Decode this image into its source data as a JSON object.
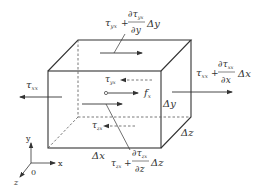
{
  "diagram": {
    "labels": {
      "top_term": "τ",
      "top_sub": "yx",
      "top_plus": "+",
      "top_num": "∂τ",
      "top_num_sub": "yx",
      "top_den": "∂y",
      "top_delta": "Δy",
      "right_term": "τ",
      "right_sub": "xx",
      "right_plus": "+",
      "right_num": "∂τ",
      "right_num_sub": "xx",
      "right_den": "∂x",
      "right_delta": "Δx",
      "left_term": "τ",
      "left_sub": "xx",
      "inner_top_term": "τ",
      "inner_top_sub": "yx",
      "body_force": "f",
      "body_force_sub": "x",
      "inner_bottom_term": "τ",
      "inner_bottom_sub": "zx",
      "bottom_term": "τ",
      "bottom_sub": "zx",
      "bottom_plus": "+",
      "bottom_num": "∂τ",
      "bottom_num_sub": "zx",
      "bottom_den": "∂z",
      "bottom_delta": "Δz",
      "dim_x": "Δx",
      "dim_y": "Δy",
      "dim_z": "Δz"
    },
    "axes": {
      "x": "x",
      "y": "y",
      "z": "z",
      "origin": "0"
    },
    "colors": {
      "line": "#333333",
      "background": "#ffffff"
    }
  }
}
